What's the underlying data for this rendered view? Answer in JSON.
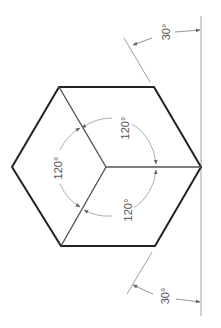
{
  "diagram": {
    "colors": {
      "outline": "#222222",
      "axis": "#555555",
      "dimension": "#888888",
      "text": "#555555"
    },
    "hexagon": {
      "vertices": [
        [
          12,
          167
        ],
        [
          59,
          87
        ],
        [
          154,
          87
        ],
        [
          201,
          167
        ],
        [
          155,
          246
        ],
        [
          61,
          246
        ]
      ],
      "center": [
        106,
        167
      ]
    },
    "angle_labels": [
      {
        "id": "top",
        "text": "120°",
        "x": 125,
        "y": 122
      },
      {
        "id": "left",
        "text": "120°",
        "x": 58,
        "y": 165
      },
      {
        "id": "bottom",
        "text": "120°",
        "x": 128,
        "y": 215
      }
    ],
    "ref_angle_labels": [
      {
        "id": "upper",
        "text": "30°",
        "x": 168,
        "y": 33
      },
      {
        "id": "lower",
        "text": "30°",
        "x": 167,
        "y": 295
      }
    ],
    "vertical_reference_line": {
      "x": 201,
      "y1": 16,
      "y2": 316
    }
  }
}
